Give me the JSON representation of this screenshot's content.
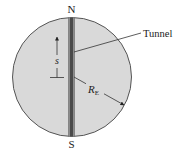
{
  "diagram": {
    "labels": {
      "north": "N",
      "south": "S",
      "tunnel": "Tunnel",
      "displacement": "s",
      "radius_main": "R",
      "radius_sub": "E"
    },
    "colors": {
      "earth_fill": "#d9d9d9",
      "earth_stroke": "#555555",
      "tunnel_dark": "#4a4a4a",
      "tunnel_light": "#8c8c8c",
      "line": "#333333",
      "text": "#222222"
    }
  }
}
